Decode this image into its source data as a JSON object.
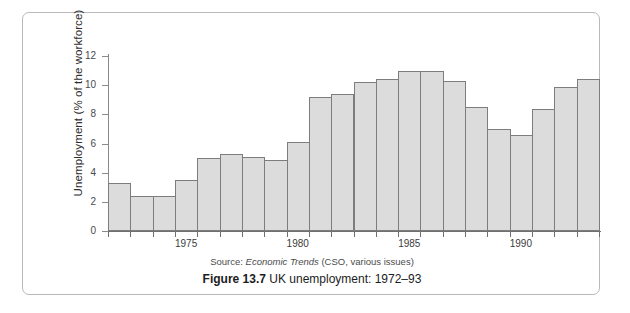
{
  "figure": {
    "source_prefix": "Source:",
    "source_italic": "Economic Trends",
    "source_suffix": "(CSO, various issues)",
    "caption_number": "Figure 13.7",
    "caption_text": "UK unemployment: 1972–93"
  },
  "chart_data": {
    "type": "bar",
    "title": "UK unemployment: 1972–93",
    "xlabel": "",
    "ylabel": "Unemployment (% of the workforce)",
    "ylim": [
      0,
      12
    ],
    "yticks": [
      0,
      2,
      4,
      6,
      8,
      10,
      12
    ],
    "ytick_labels": [
      "0",
      "2",
      "4",
      "6",
      "8",
      "10",
      "12"
    ],
    "xtick_labels": [
      "1975",
      "1980",
      "1985",
      "1990"
    ],
    "xtick_years": [
      1975,
      1980,
      1985,
      1990
    ],
    "grid": false,
    "legend": null,
    "bar_fill": "#dcdcdc",
    "bar_edge": "#7d7d7d",
    "categories": [
      "1972",
      "1973",
      "1974",
      "1975",
      "1976",
      "1977",
      "1978",
      "1979",
      "1980",
      "1981",
      "1982",
      "1983",
      "1984",
      "1985",
      "1986",
      "1987",
      "1988",
      "1989",
      "1990",
      "1991",
      "1992",
      "1993"
    ],
    "values": [
      3.3,
      2.4,
      2.4,
      3.5,
      5.0,
      5.3,
      5.1,
      4.9,
      6.1,
      9.2,
      9.4,
      10.2,
      10.4,
      11.0,
      11.0,
      10.3,
      8.5,
      7.0,
      6.6,
      8.4,
      9.9,
      10.4
    ]
  }
}
